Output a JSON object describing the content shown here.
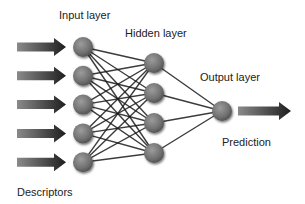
{
  "labels": {
    "input_layer": "Input layer",
    "hidden_layer": "Hidden layer",
    "output_layer": "Output layer",
    "prediction": "Prediction",
    "descriptors": "Descriptors"
  },
  "network": {
    "input_nodes": 5,
    "hidden_nodes": 4,
    "output_nodes": 1,
    "connections": "fully-connected"
  },
  "colors": {
    "node_fill": "#7a7a7a",
    "node_highlight": "#a8a8a8",
    "edge": "#1a1a1a",
    "arrow_dark": "#1e1e1e",
    "arrow_light": "#8a8a8a",
    "text": "#222222"
  }
}
